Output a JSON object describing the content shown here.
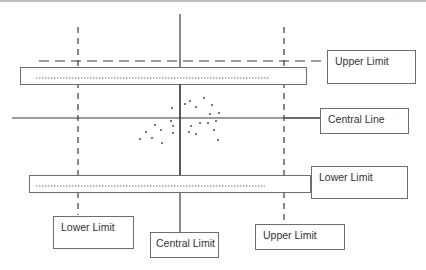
{
  "diagram": {
    "colors": {
      "line": "#3a3a3a",
      "box_border": "#6e6e6e",
      "text": "#333333",
      "background": "#ffffff"
    },
    "labels": {
      "upper_limit_right": "Upper Limit",
      "central_line": "Central Line",
      "lower_limit_right": "Lower Limit",
      "lower_limit_bottom": "Lower Limit",
      "central_limit_bottom": "Central Limit",
      "upper_limit_bottom": "Upper Limit"
    },
    "lines": {
      "horizontal_central": {
        "style": "solid",
        "y": 118
      },
      "horizontal_upper_limit": {
        "style": "dashed",
        "y": 61
      },
      "vertical_central": {
        "style": "solid",
        "x": 180
      },
      "vertical_lower_limit": {
        "style": "dashed",
        "x": 78
      },
      "vertical_upper_limit": {
        "style": "dashed",
        "x": 284
      }
    },
    "bands": [
      {
        "name": "upper-band",
        "style": "dotted-inside-box"
      },
      {
        "name": "lower-band",
        "style": "dotted-inside-box"
      }
    ],
    "scatter_points": [
      [
        172,
        108
      ],
      [
        185,
        104
      ],
      [
        190,
        101
      ],
      [
        204,
        98
      ],
      [
        196,
        107
      ],
      [
        212,
        105
      ],
      [
        210,
        114
      ],
      [
        219,
        113
      ],
      [
        171,
        121
      ],
      [
        173,
        126
      ],
      [
        191,
        126
      ],
      [
        200,
        123
      ],
      [
        208,
        123
      ],
      [
        216,
        121
      ],
      [
        155,
        125
      ],
      [
        146,
        132
      ],
      [
        161,
        130
      ],
      [
        173,
        133
      ],
      [
        189,
        132
      ],
      [
        196,
        134
      ],
      [
        214,
        130
      ],
      [
        140,
        139
      ],
      [
        152,
        138
      ],
      [
        162,
        143
      ],
      [
        218,
        140
      ]
    ]
  }
}
